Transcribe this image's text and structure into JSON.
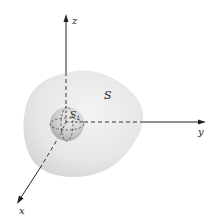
{
  "figure": {
    "surfaces": {
      "outer_label": "S",
      "inner_label": "S",
      "inner_subscript": "1"
    },
    "axes": {
      "x_label": "x",
      "y_label": "y",
      "z_label": "z"
    },
    "colors": {
      "outer_surface": "#e4e4e4",
      "inner_sphere": "#c8c8c8",
      "axis": "#222222"
    }
  }
}
